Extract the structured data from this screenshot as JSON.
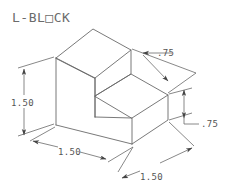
{
  "drawing": {
    "title": "L-BL□CK",
    "title_plain": "L-BLOCK",
    "background_color": "#ffffff",
    "line_color": "#555555",
    "text_color": "#5a5a5a",
    "projection": "isometric",
    "units": "inches",
    "object_name": "L-Block",
    "dimensions": [
      {
        "id": "height-left",
        "label": "1.50",
        "position": "left",
        "orientation": "vertical",
        "measures": "overall height",
        "arrows": "both-ends"
      },
      {
        "id": "depth-bottom-left",
        "label": "1.50",
        "position": "bottom-left",
        "orientation": "isometric-left",
        "measures": "depth",
        "arrows": "both-ends"
      },
      {
        "id": "width-bottom-right",
        "label": "1.50",
        "position": "bottom-right",
        "orientation": "isometric-right",
        "measures": "width",
        "arrows": "both-ends"
      },
      {
        "id": "step-depth-top-right",
        "label": ".75",
        "position": "top-right",
        "orientation": "leader",
        "measures": "step depth",
        "arrows": "leader"
      },
      {
        "id": "step-height-right",
        "label": ".75",
        "position": "right",
        "orientation": "vertical",
        "measures": "step height",
        "arrows": "both-ends"
      }
    ]
  }
}
